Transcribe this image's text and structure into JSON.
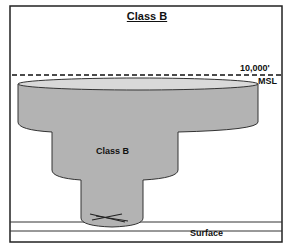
{
  "title": "Class B",
  "labels": {
    "altitude": "10,000'",
    "altitude_ref": "MSL",
    "airspace": "Class B",
    "ground": "Surface"
  },
  "colors": {
    "airspace_fill": "#b3b3b3",
    "airspace_top": "#d9d9d9",
    "outline": "#222222",
    "background": "#ffffff"
  },
  "tiers": [
    {
      "name": "outer-shelf",
      "ceiling": "10,000' MSL"
    },
    {
      "name": "middle-shelf"
    },
    {
      "name": "surface-area",
      "floor": "Surface"
    }
  ]
}
